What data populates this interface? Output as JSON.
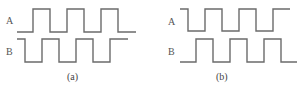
{
  "panels": [
    {
      "caption": "(a)",
      "signals": [
        {
          "label": "A",
          "description": "square wave starting low, rising first",
          "initial_level": "low"
        },
        {
          "label": "B",
          "description": "square wave starting high, falling first",
          "initial_level": "high"
        }
      ],
      "relation": "A leads/lags B by quarter period"
    },
    {
      "caption": "(b)",
      "signals": [
        {
          "label": "A",
          "description": "square wave starting high, falling first",
          "initial_level": "high"
        },
        {
          "label": "B",
          "description": "square wave starting low, rising first",
          "initial_level": "low"
        }
      ],
      "relation": "phase relationship reversed relative to (a)"
    }
  ],
  "colors": {
    "line": "#6b6b6b",
    "text": "#555555",
    "background": "#ffffff"
  }
}
